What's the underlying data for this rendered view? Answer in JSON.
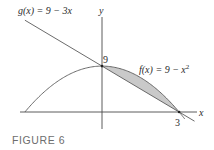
{
  "figure": {
    "caption": "FIGURE 6"
  },
  "chart_data": {
    "type": "line",
    "title": "",
    "xlabel": "x",
    "ylabel": "y",
    "series": [
      {
        "name": "f(x) = 9 − x²",
        "label_text": "f(x) = 9 − x",
        "label_sup": "2",
        "expr": "9 - x^2",
        "x": [
          -3,
          -2,
          -1,
          0,
          1,
          2,
          3
        ],
        "values": [
          0,
          5,
          8,
          9,
          8,
          5,
          0
        ]
      },
      {
        "name": "g(x) = 9 − 3x",
        "label_text": "g(x) = 9 − 3x",
        "expr": "9 - 3x",
        "x": [
          -3,
          0,
          3,
          3.6
        ],
        "values": [
          18,
          9,
          0,
          -1.8
        ]
      }
    ],
    "shaded_region": {
      "between": [
        "f",
        "g"
      ],
      "x_from": 0,
      "x_to": 3,
      "color": "#c9c9c9"
    },
    "annotations": [
      {
        "text": "9",
        "at": [
          0,
          9
        ]
      },
      {
        "text": "3",
        "at": [
          3,
          0
        ]
      }
    ],
    "xlim": [
      -3.2,
      3.8
    ],
    "ylim": [
      -3,
      20
    ],
    "grid": false,
    "legend": "inline labels"
  },
  "colors": {
    "curve": "#5a5a5a",
    "axis": "#4a4a4a",
    "fill": "#c9c9c9",
    "caption": "#6d6d6d"
  }
}
